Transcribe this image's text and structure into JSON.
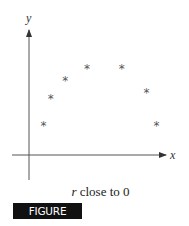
{
  "figure": {
    "label": "FIGURE 4.135",
    "caption_var": "r",
    "caption_rest": " close to 0"
  },
  "chart_data": {
    "type": "scatter",
    "title": "",
    "xlabel": "x",
    "ylabel": "y",
    "grid": false,
    "legend": null,
    "marker": "*",
    "caption": "r close to 0",
    "figure_label": "FIGURE 4.135",
    "points": [
      {
        "x": 1.0,
        "y": 1.0
      },
      {
        "x": 1.5,
        "y": 1.9
      },
      {
        "x": 2.5,
        "y": 2.5
      },
      {
        "x": 4.0,
        "y": 2.9
      },
      {
        "x": 6.4,
        "y": 2.9
      },
      {
        "x": 8.1,
        "y": 2.1
      },
      {
        "x": 8.8,
        "y": 1.0
      }
    ],
    "xlim": [
      0,
      9.5
    ],
    "ylim": [
      0,
      3.8
    ],
    "note": "Points follow an inverted-U (parabolic) pattern; linear correlation r is close to 0"
  },
  "layout": {
    "origin_px": [
      29,
      155
    ],
    "x_scale_px": 14.5,
    "y_scale_px": 30,
    "axis_color": "#444444",
    "marker_color": "#555555"
  }
}
